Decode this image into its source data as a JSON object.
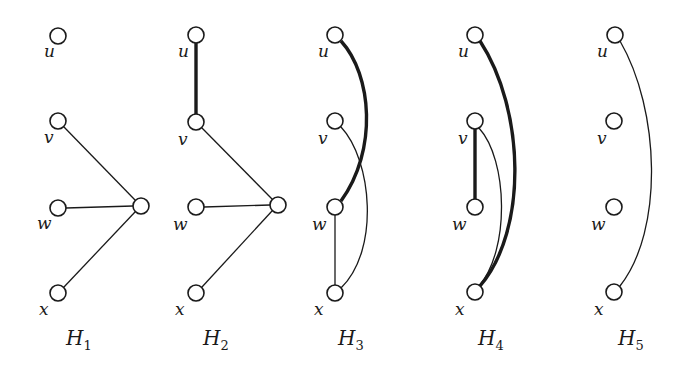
{
  "figure": {
    "node_radius": 8,
    "colors": {
      "stroke": "#1a1a1a",
      "background": "#ffffff"
    },
    "graphs": [
      {
        "name": "H",
        "sub": "1",
        "label_pos": [
          66,
          345
        ],
        "nodes": [
          {
            "id": "u",
            "label": "u",
            "cx": 58,
            "cy": 36,
            "lx": 44,
            "ly": 57
          },
          {
            "id": "v",
            "label": "v",
            "cx": 58,
            "cy": 121,
            "lx": 44,
            "ly": 143
          },
          {
            "id": "w",
            "label": "w",
            "cx": 58,
            "cy": 208,
            "lx": 37,
            "ly": 229
          },
          {
            "id": "x",
            "label": "x",
            "cx": 58,
            "cy": 293,
            "lx": 39,
            "ly": 315
          },
          {
            "id": "hub",
            "label": "",
            "cx": 141,
            "cy": 206
          }
        ],
        "edges": [
          {
            "from": "v",
            "to": "hub",
            "thick": false,
            "path": "M64,127 L135,200"
          },
          {
            "from": "w",
            "to": "hub",
            "thick": false,
            "path": "M66,208 L133,206"
          },
          {
            "from": "x",
            "to": "hub",
            "thick": false,
            "path": "M64,287 L135,212"
          }
        ]
      },
      {
        "name": "H",
        "sub": "2",
        "label_pos": [
          203,
          345
        ],
        "nodes": [
          {
            "id": "u",
            "label": "u",
            "cx": 196,
            "cy": 35,
            "lx": 178,
            "ly": 57
          },
          {
            "id": "v",
            "label": "v",
            "cx": 196,
            "cy": 122,
            "lx": 178,
            "ly": 145
          },
          {
            "id": "w",
            "label": "w",
            "cx": 196,
            "cy": 207,
            "lx": 173,
            "ly": 230
          },
          {
            "id": "x",
            "label": "x",
            "cx": 196,
            "cy": 293,
            "lx": 175,
            "ly": 315
          },
          {
            "id": "hub",
            "label": "",
            "cx": 278,
            "cy": 205
          }
        ],
        "edges": [
          {
            "from": "u",
            "to": "v",
            "thick": true,
            "path": "M196,43 L196,114"
          },
          {
            "from": "v",
            "to": "hub",
            "thick": false,
            "path": "M202,128 L272,199"
          },
          {
            "from": "w",
            "to": "hub",
            "thick": false,
            "path": "M204,207 L270,205"
          },
          {
            "from": "x",
            "to": "hub",
            "thick": false,
            "path": "M202,287 L272,211"
          }
        ]
      },
      {
        "name": "H",
        "sub": "3",
        "label_pos": [
          338,
          345
        ],
        "nodes": [
          {
            "id": "u",
            "label": "u",
            "cx": 335,
            "cy": 35,
            "lx": 318,
            "ly": 57
          },
          {
            "id": "v",
            "label": "v",
            "cx": 335,
            "cy": 121,
            "lx": 318,
            "ly": 144
          },
          {
            "id": "w",
            "label": "w",
            "cx": 335,
            "cy": 207,
            "lx": 312,
            "ly": 230
          },
          {
            "id": "x",
            "label": "x",
            "cx": 335,
            "cy": 293,
            "lx": 314,
            "ly": 315
          }
        ],
        "edges": [
          {
            "from": "u",
            "to": "w",
            "thick": true,
            "path": "M341,41 C372,75 378,150 341,201"
          },
          {
            "from": "v",
            "to": "x",
            "thick": false,
            "path": "M341,127 C372,160 380,250 341,288"
          },
          {
            "from": "w",
            "to": "x",
            "thick": false,
            "path": "M335,215 L335,285"
          }
        ]
      },
      {
        "name": "H",
        "sub": "4",
        "label_pos": [
          478,
          345
        ],
        "nodes": [
          {
            "id": "u",
            "label": "u",
            "cx": 475,
            "cy": 35,
            "lx": 458,
            "ly": 57
          },
          {
            "id": "v",
            "label": "v",
            "cx": 475,
            "cy": 121,
            "lx": 458,
            "ly": 144
          },
          {
            "id": "w",
            "label": "w",
            "cx": 475,
            "cy": 207,
            "lx": 452,
            "ly": 230
          },
          {
            "id": "x",
            "label": "x",
            "cx": 475,
            "cy": 292,
            "lx": 455,
            "ly": 315
          }
        ],
        "edges": [
          {
            "from": "u",
            "to": "x",
            "thick": true,
            "path": "M480,41 C525,110 528,230 480,286"
          },
          {
            "from": "v",
            "to": "w",
            "thick": true,
            "path": "M475,129 L475,199"
          },
          {
            "from": "v",
            "to": "x",
            "thick": false,
            "path": "M479,128 C508,160 510,250 479,286"
          }
        ]
      },
      {
        "name": "H",
        "sub": "5",
        "label_pos": [
          618,
          345
        ],
        "nodes": [
          {
            "id": "u",
            "label": "u",
            "cx": 615,
            "cy": 35,
            "lx": 597,
            "ly": 57
          },
          {
            "id": "v",
            "label": "v",
            "cx": 614,
            "cy": 121,
            "lx": 597,
            "ly": 144
          },
          {
            "id": "w",
            "label": "w",
            "cx": 614,
            "cy": 207,
            "lx": 591,
            "ly": 230
          },
          {
            "id": "x",
            "label": "x",
            "cx": 614,
            "cy": 292,
            "lx": 594,
            "ly": 315
          }
        ],
        "edges": [
          {
            "from": "u",
            "to": "x",
            "thick": false,
            "path": "M620,41 C660,110 664,230 620,286"
          }
        ]
      }
    ]
  }
}
